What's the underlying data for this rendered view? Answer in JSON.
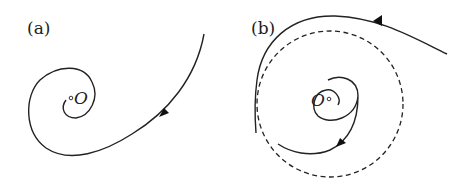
{
  "panels": [
    {
      "label": "(a)",
      "origin_label": "O",
      "description": "Stable spiral trajectory approaching the origin",
      "arrow_direction": "inward"
    },
    {
      "label": "(b)",
      "origin_label": "O",
      "description": "Trajectories approaching a limit cycle (dashed circle) from outside and inside",
      "limit_cycle": "dashed",
      "arrow_direction": "toward-limit-cycle"
    }
  ],
  "colors": {
    "stroke": "#222222",
    "background": "#ffffff"
  }
}
